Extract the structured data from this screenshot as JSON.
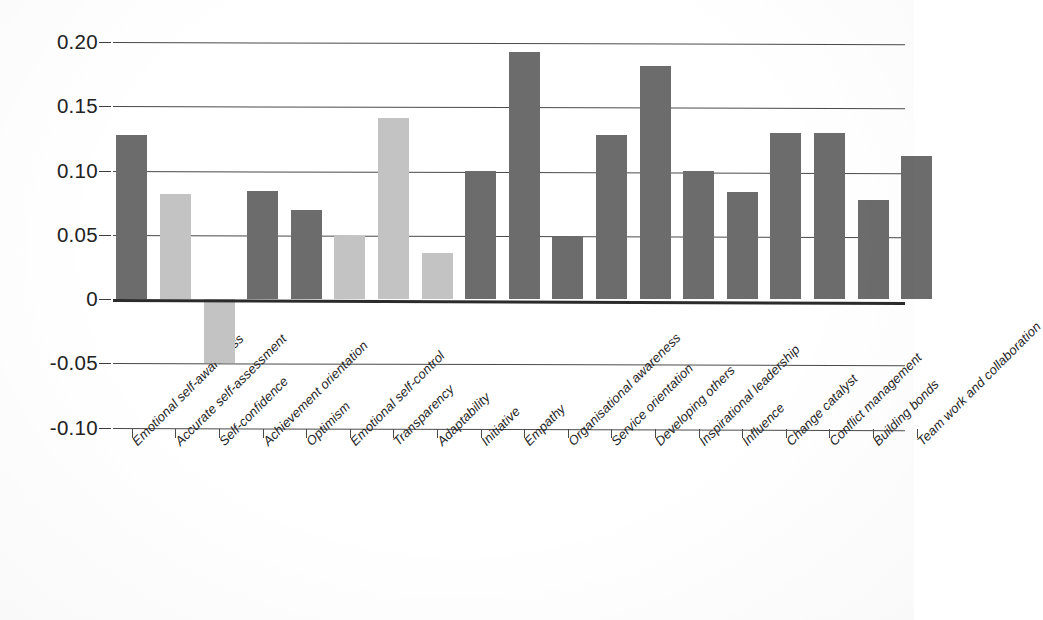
{
  "chart_data": {
    "type": "bar",
    "title": "",
    "subtitle": "",
    "xlabel": "",
    "ylabel": "",
    "ylim": [
      -0.1,
      0.2
    ],
    "yticks": [
      0.2,
      0.15,
      0.1,
      0.05,
      0,
      -0.05,
      -0.1
    ],
    "ytick_labels": [
      "0.20",
      "0.15",
      "0.10",
      "0.05",
      "0",
      "-0.05",
      "-0.10"
    ],
    "grid": true,
    "legend": "none",
    "orientation": "vertical",
    "series_colors": {
      "dark": "#6c6c6c",
      "light": "#c3c3c3"
    },
    "categories": [
      "Emotional self-awareness",
      "Accurate self-assessment",
      "Self-confidence",
      "Achievement orientation",
      "Optimism",
      "Emotional self-control",
      "Transparency",
      "Adaptability",
      "Initiative",
      "Empathy",
      "Organisational awareness",
      "Service orientation",
      "Developing others",
      "Inspirational leadership",
      "Influence",
      "Change catalyst",
      "Conflict management",
      "Building bonds",
      "Team work and collaboration"
    ],
    "values": [
      0.128,
      0.082,
      -0.05,
      0.084,
      0.069,
      0.049,
      0.141,
      0.036,
      0.1,
      0.192,
      0.048,
      0.128,
      0.181,
      0.1,
      0.083,
      0.129,
      0.129,
      0.077,
      0.111
    ],
    "bar_shades": [
      "dark",
      "light",
      "light",
      "dark",
      "dark",
      "light",
      "light",
      "light",
      "dark",
      "dark",
      "dark",
      "dark",
      "dark",
      "dark",
      "dark",
      "dark",
      "dark",
      "dark",
      "dark"
    ]
  }
}
